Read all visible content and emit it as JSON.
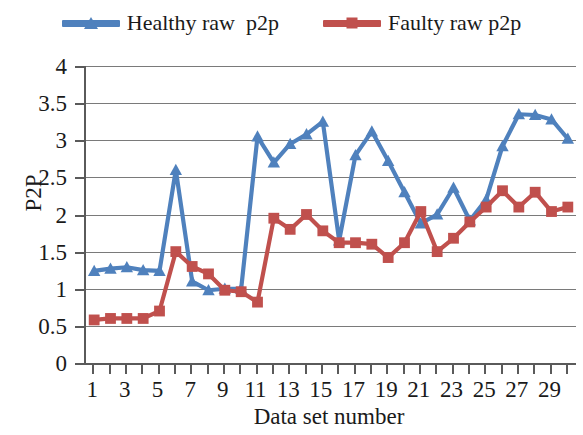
{
  "chart_data": {
    "type": "line",
    "title": "",
    "xlabel": "Data set number",
    "ylabel": "P2P",
    "xlim": [
      0.5,
      30.5
    ],
    "ylim": [
      0,
      4
    ],
    "ytick_labels": [
      "0",
      "0.5",
      "1",
      "1.5",
      "2",
      "2.5",
      "3",
      "3.5",
      "4"
    ],
    "ytick_values": [
      0,
      0.5,
      1,
      1.5,
      2,
      2.5,
      3,
      3.5,
      4
    ],
    "xtick_labels": [
      "1",
      "3",
      "5",
      "7",
      "9",
      "11",
      "13",
      "15",
      "17",
      "19",
      "21",
      "23",
      "25",
      "27",
      "29"
    ],
    "xtick_values": [
      1,
      3,
      5,
      7,
      9,
      11,
      13,
      15,
      17,
      19,
      21,
      23,
      25,
      27,
      29
    ],
    "x": [
      1,
      2,
      3,
      4,
      5,
      6,
      7,
      8,
      9,
      10,
      11,
      12,
      13,
      14,
      15,
      16,
      17,
      18,
      19,
      20,
      21,
      22,
      23,
      24,
      25,
      26,
      27,
      28,
      29,
      30
    ],
    "grid": "horizontal",
    "legend_position": "top-center",
    "series": [
      {
        "name": "Healthy raw  p2p",
        "color": "#4F81BD",
        "marker": "triangle",
        "values": [
          1.24,
          1.27,
          1.29,
          1.25,
          1.24,
          2.6,
          1.1,
          0.98,
          1.0,
          1.0,
          3.05,
          2.7,
          2.95,
          3.08,
          3.25,
          1.65,
          2.8,
          3.12,
          2.72,
          2.3,
          1.88,
          2.0,
          2.36,
          1.92,
          2.2,
          2.92,
          3.35,
          3.34,
          3.28,
          3.02
        ]
      },
      {
        "name": "Faulty raw p2p",
        "color": "#C0504D",
        "marker": "square",
        "values": [
          0.58,
          0.6,
          0.6,
          0.6,
          0.7,
          1.5,
          1.3,
          1.2,
          0.98,
          0.96,
          0.82,
          1.95,
          1.8,
          2.0,
          1.78,
          1.62,
          1.62,
          1.6,
          1.42,
          1.62,
          2.04,
          1.5,
          1.68,
          1.9,
          2.1,
          2.32,
          2.1,
          2.3,
          2.04,
          2.1
        ]
      }
    ]
  },
  "legend": {
    "entries": [
      {
        "label": "Healthy raw  p2p",
        "color": "#4F81BD",
        "marker_icon": "triangle-marker-icon"
      },
      {
        "label": "Faulty raw p2p",
        "color": "#C0504D",
        "marker_icon": "square-marker-icon"
      }
    ]
  },
  "axes": {
    "y_title": "P2P",
    "x_title": "Data set number"
  },
  "colors": {
    "healthy": "#4F81BD",
    "faulty": "#C0504D",
    "grid": "#7a7a7a",
    "axis": "#5a5a5a",
    "background": "#ffffff"
  }
}
